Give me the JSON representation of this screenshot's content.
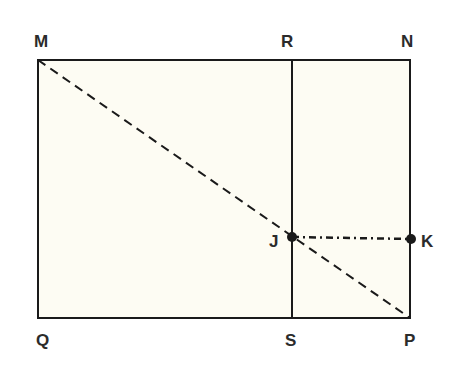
{
  "diagram": {
    "type": "geometry",
    "colors": {
      "fill": "#fdfcf3",
      "stroke": "#1a1a1a",
      "label": "#2b2b2b"
    },
    "points": {
      "M": "M",
      "N": "N",
      "P": "P",
      "Q": "Q",
      "R": "R",
      "S": "S",
      "J": "J",
      "K": "K"
    },
    "segments": [
      {
        "from": "M",
        "to": "N",
        "style": "solid"
      },
      {
        "from": "N",
        "to": "P",
        "style": "solid"
      },
      {
        "from": "P",
        "to": "Q",
        "style": "solid"
      },
      {
        "from": "Q",
        "to": "M",
        "style": "solid"
      },
      {
        "from": "R",
        "to": "S",
        "style": "solid"
      },
      {
        "from": "M",
        "to": "P",
        "style": "dashed"
      },
      {
        "from": "J",
        "to": "K",
        "style": "dotted"
      }
    ],
    "marked_points": [
      "J",
      "K"
    ]
  }
}
